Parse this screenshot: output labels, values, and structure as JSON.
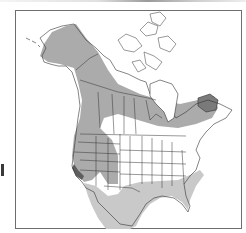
{
  "map": {
    "region": "North America",
    "type": "species range map",
    "legend_visible": false,
    "colors": {
      "background": "#ffffff",
      "frame": "#6e6e6e",
      "outline": "#333333",
      "range_primary": "#a9a9a9",
      "range_winter": "#c8c8c8",
      "range_dense": "#6a6a6a"
    },
    "ranges": [
      {
        "name": "primary-range",
        "shade": "medium gray",
        "areas": [
          "Alaska",
          "Yukon",
          "British Columbia",
          "Alberta",
          "Saskatchewan",
          "Manitoba",
          "northern Ontario",
          "Quebec",
          "Labrador",
          "US Pacific Northwest",
          "Rocky Mountain states",
          "California"
        ]
      },
      {
        "name": "winter-range",
        "shade": "light gray",
        "areas": [
          "Mexico",
          "Texas",
          "Gulf Coast",
          "southeastern US",
          "Atlantic coast"
        ]
      },
      {
        "name": "dense-range",
        "shade": "dark gray",
        "areas": [
          "coastal California",
          "Newfoundland/Labrador coast"
        ]
      }
    ]
  }
}
